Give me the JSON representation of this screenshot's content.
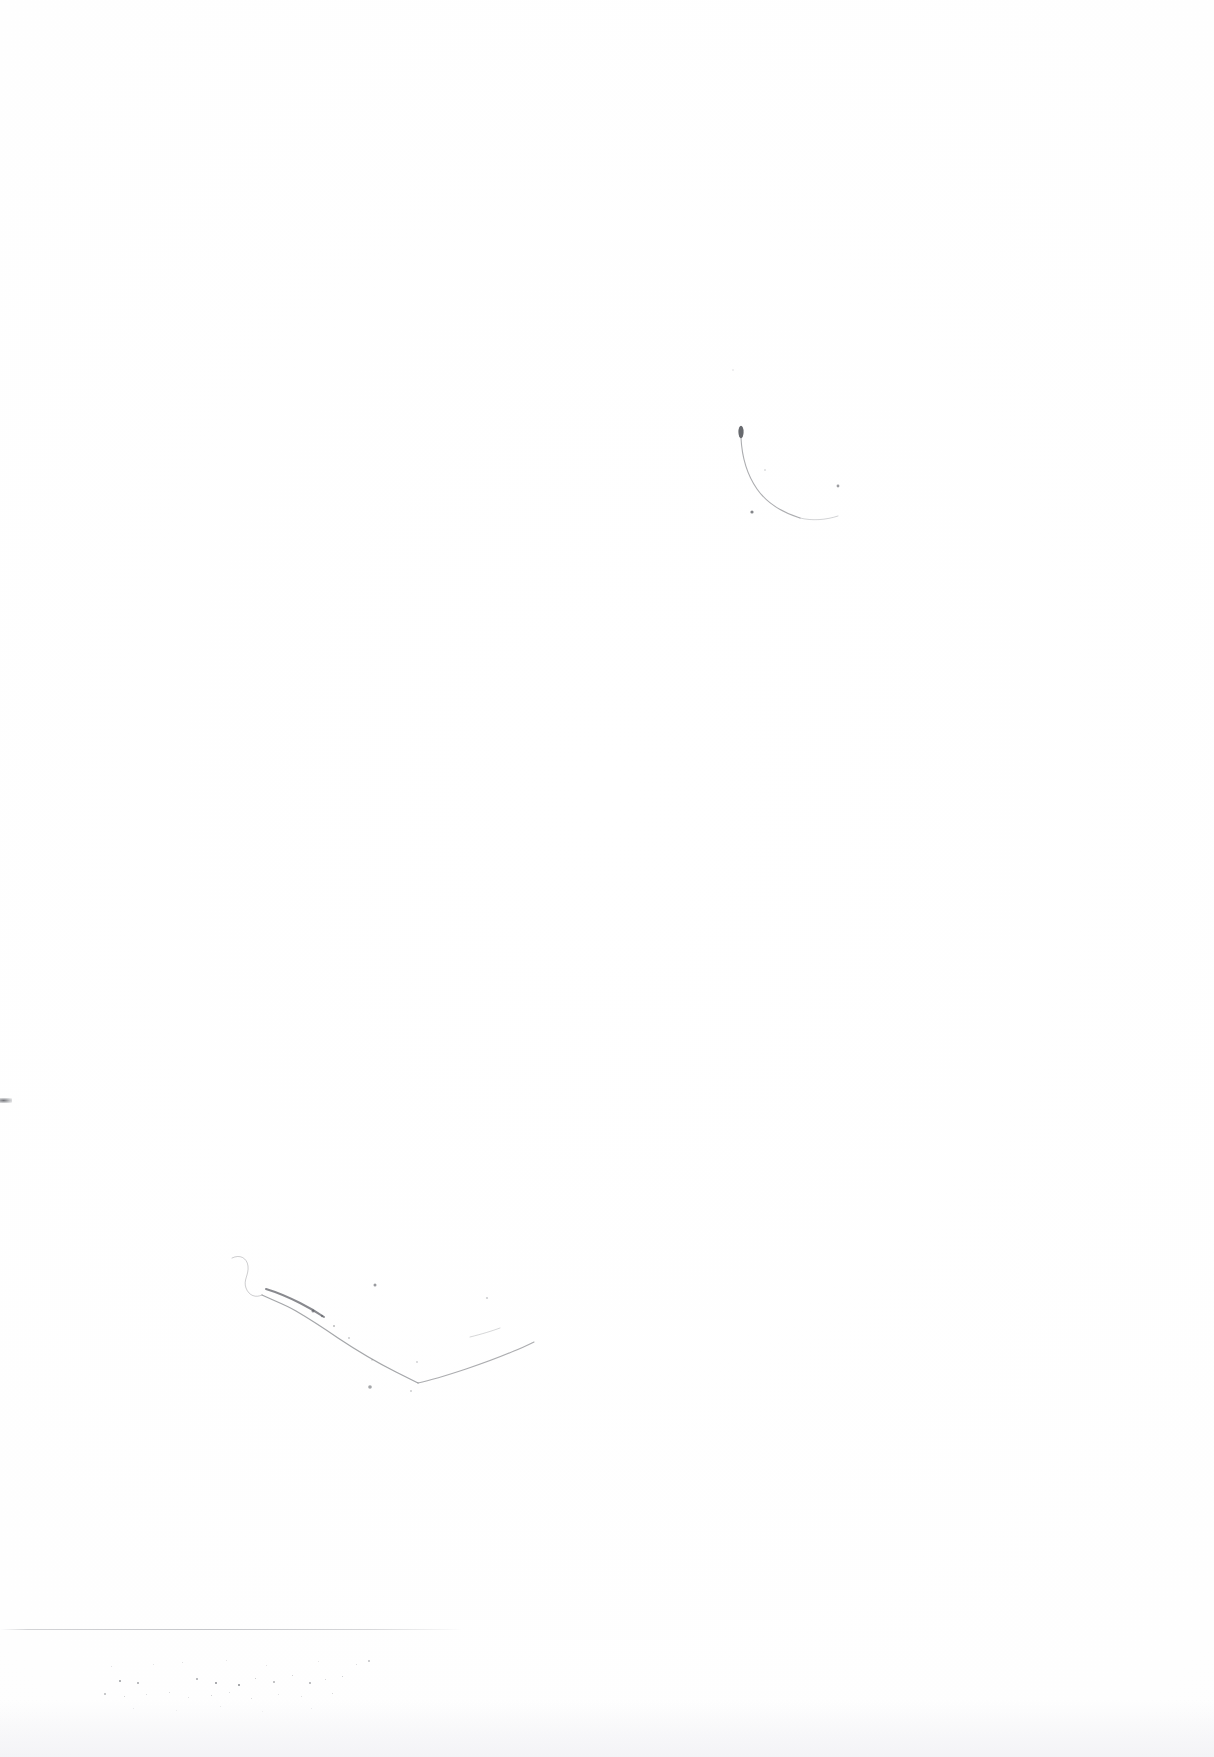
{
  "document": {
    "kind": "scanned-blank-page",
    "page_width": 1214,
    "page_height": 1757,
    "background_color": "#fefefe",
    "ink_color": "#5a5c62",
    "caption": ""
  },
  "artifacts": {
    "upper_right_stroke": {
      "label": "",
      "name": "curved-ink-stroke",
      "description": "",
      "bbox": [
        728,
        424,
        116,
        100
      ],
      "blob": {
        "cx": 741,
        "cy": 432,
        "rx": 2.6,
        "ry": 6.2,
        "opacity": 0.92
      },
      "path": "M741,438 C742,458 748,476 757,489 C766,502 781,512 800,518",
      "stroke_width": 1.1,
      "opacity": 0.5,
      "tail": {
        "path": "M800,518 C812,521 826,520 838,516",
        "stroke_width": 0.9,
        "opacity": 0.3
      },
      "specks": [
        {
          "cx": 752,
          "cy": 512,
          "r": 1.6,
          "opacity": 0.75
        },
        {
          "cx": 838,
          "cy": 486,
          "r": 1.4,
          "opacity": 0.6
        },
        {
          "cx": 765,
          "cy": 470,
          "r": 0.8,
          "opacity": 0.35
        },
        {
          "cx": 733,
          "cy": 370,
          "r": 1.0,
          "opacity": 0.12
        }
      ]
    },
    "lower_left_stroke": {
      "label": "",
      "name": "v-shaped-ink-stroke",
      "description": "",
      "bbox": [
        228,
        1252,
        314,
        250
      ],
      "hook": {
        "path": "M232,1258 C240,1254 247,1258 248,1266 C249,1275 243,1280 246,1288 C249,1296 256,1298 262,1295",
        "stroke_width": 0.9,
        "opacity": 0.34
      },
      "descending_arm": {
        "path": "M262,1295 C272,1300 284,1304 296,1311 C308,1318 322,1327 338,1338 C356,1350 376,1362 396,1372 C406,1377 412,1380 418,1383",
        "stroke_width": 1.25,
        "opacity": 0.55
      },
      "dark_segment": {
        "path": "M266,1289 C276,1292 288,1297 300,1303 C310,1308 318,1313 324,1317",
        "stroke_width": 2.0,
        "opacity": 0.72
      },
      "rising_arm": {
        "path": "M418,1383 C432,1380 448,1375 466,1369 C484,1363 500,1357 514,1351 C522,1348 528,1345 534,1342",
        "stroke_width": 1.15,
        "opacity": 0.5
      },
      "rising_arm_tip": {
        "path": "M470,1337 C482,1334 492,1331 500,1328",
        "stroke_width": 0.9,
        "opacity": 0.28
      },
      "specks": [
        {
          "cx": 313,
          "cy": 1311,
          "r": 1.5,
          "opacity": 0.62
        },
        {
          "cx": 322,
          "cy": 1316,
          "r": 1.2,
          "opacity": 0.5
        },
        {
          "cx": 334,
          "cy": 1326,
          "r": 1.0,
          "opacity": 0.42
        },
        {
          "cx": 349,
          "cy": 1338,
          "r": 0.9,
          "opacity": 0.35
        },
        {
          "cx": 375,
          "cy": 1285,
          "r": 1.5,
          "opacity": 0.62
        },
        {
          "cx": 417,
          "cy": 1362,
          "r": 0.9,
          "opacity": 0.3
        },
        {
          "cx": 372,
          "cy": 1360,
          "r": 0.8,
          "opacity": 0.28
        },
        {
          "cx": 370,
          "cy": 1387,
          "r": 1.8,
          "opacity": 0.55
        },
        {
          "cx": 411,
          "cy": 1391,
          "r": 1.0,
          "opacity": 0.3
        },
        {
          "cx": 487,
          "cy": 1298,
          "r": 1.1,
          "opacity": 0.3
        }
      ]
    },
    "edge_speck": {
      "label": "",
      "name": "left-edge-speck",
      "bbox": [
        0,
        1098,
        12,
        5
      ]
    },
    "bottom_rule": {
      "label": "",
      "name": "bottom-horizontal-rule",
      "x": 0,
      "y": 1629,
      "width": 462,
      "height": 1
    },
    "speckle_field": {
      "label": "",
      "name": "scanner-dust-speckles",
      "bbox": [
        80,
        1648,
        300,
        78
      ],
      "dots": [
        {
          "x": 39,
          "y": 32,
          "s": 2.0,
          "o": 0.7
        },
        {
          "x": 57,
          "y": 34,
          "s": 1.9,
          "o": 0.62
        },
        {
          "x": 116,
          "y": 30,
          "s": 1.6,
          "o": 0.55
        },
        {
          "x": 135,
          "y": 34,
          "s": 2.2,
          "o": 0.78
        },
        {
          "x": 158,
          "y": 36,
          "s": 2.4,
          "o": 0.82
        },
        {
          "x": 175,
          "y": 30,
          "s": 1.4,
          "o": 0.45
        },
        {
          "x": 193,
          "y": 33,
          "s": 1.5,
          "o": 0.48
        },
        {
          "x": 212,
          "y": 27,
          "s": 1.3,
          "o": 0.4
        },
        {
          "x": 229,
          "y": 34,
          "s": 1.6,
          "o": 0.52
        },
        {
          "x": 245,
          "y": 31,
          "s": 1.2,
          "o": 0.36
        },
        {
          "x": 262,
          "y": 28,
          "s": 1.4,
          "o": 0.42
        },
        {
          "x": 24,
          "y": 45,
          "s": 1.5,
          "o": 0.44
        },
        {
          "x": 44,
          "y": 48,
          "s": 1.3,
          "o": 0.38
        },
        {
          "x": 66,
          "y": 46,
          "s": 1.1,
          "o": 0.3
        },
        {
          "x": 89,
          "y": 44,
          "s": 1.2,
          "o": 0.33
        },
        {
          "x": 108,
          "y": 49,
          "s": 1.0,
          "o": 0.28
        },
        {
          "x": 131,
          "y": 47,
          "s": 1.4,
          "o": 0.4
        },
        {
          "x": 149,
          "y": 44,
          "s": 1.1,
          "o": 0.3
        },
        {
          "x": 171,
          "y": 50,
          "s": 1.2,
          "o": 0.32
        },
        {
          "x": 198,
          "y": 46,
          "s": 1.0,
          "o": 0.26
        },
        {
          "x": 221,
          "y": 48,
          "s": 1.1,
          "o": 0.28
        },
        {
          "x": 252,
          "y": 45,
          "s": 1.3,
          "o": 0.34
        },
        {
          "x": 31,
          "y": 18,
          "s": 1.1,
          "o": 0.26
        },
        {
          "x": 73,
          "y": 16,
          "s": 1.0,
          "o": 0.24
        },
        {
          "x": 102,
          "y": 14,
          "s": 1.2,
          "o": 0.28
        },
        {
          "x": 146,
          "y": 12,
          "s": 1.0,
          "o": 0.22
        },
        {
          "x": 186,
          "y": 17,
          "s": 1.1,
          "o": 0.25
        },
        {
          "x": 238,
          "y": 13,
          "s": 1.0,
          "o": 0.22
        },
        {
          "x": 276,
          "y": 16,
          "s": 1.2,
          "o": 0.3
        },
        {
          "x": 288,
          "y": 12,
          "s": 1.5,
          "o": 0.4
        },
        {
          "x": 53,
          "y": 60,
          "s": 1.0,
          "o": 0.22
        },
        {
          "x": 96,
          "y": 62,
          "s": 0.9,
          "o": 0.2
        },
        {
          "x": 140,
          "y": 58,
          "s": 1.0,
          "o": 0.22
        },
        {
          "x": 182,
          "y": 63,
          "s": 0.9,
          "o": 0.18
        },
        {
          "x": 231,
          "y": 60,
          "s": 1.0,
          "o": 0.2
        }
      ]
    }
  }
}
